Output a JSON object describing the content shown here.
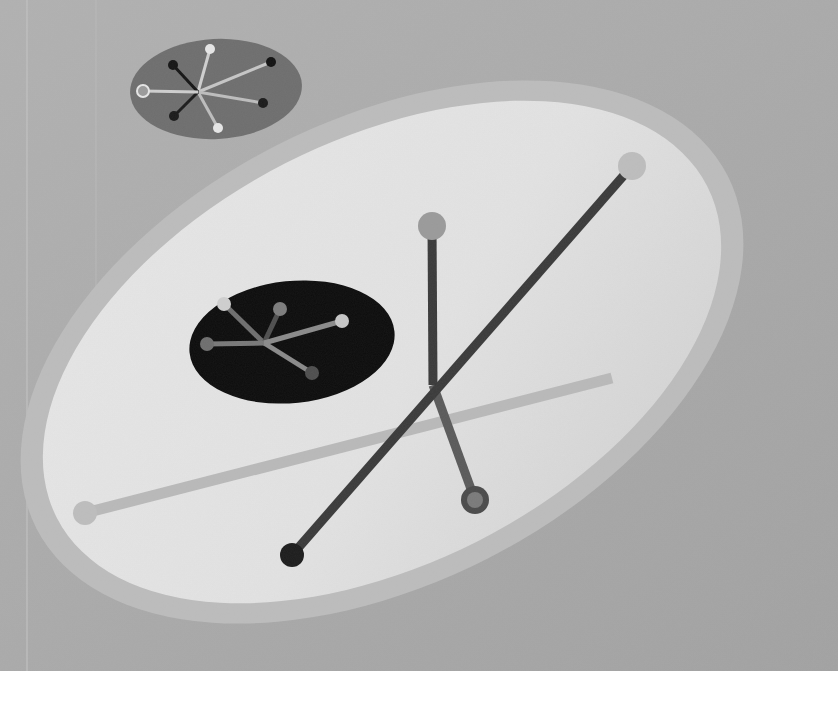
{
  "artwork": {
    "kind": "abstract painting (grayscale reproduction)",
    "canvas": {
      "width": 838,
      "height": 671
    },
    "colors": {
      "background": "#a9a9a9",
      "background_light": "#b4b4b4",
      "halo": "#bcbcbc",
      "big_ellipse": "#e3e3e3",
      "big_ellipse_shade": "#d2d2d2",
      "small_ellipse_top": "#6e6e6e",
      "small_ellipse_dark": "#0c0c0c",
      "line_dark": "#3a3a3a",
      "line_mid": "#5a5a5a",
      "line_light": "#b9b9b9",
      "page_margin": "#ffffff"
    },
    "shapes": {
      "halo": {
        "cx": 382,
        "cy": 352,
        "rx": 388,
        "ry": 232,
        "rotate": -27
      },
      "big_ellipse": {
        "cx": 382,
        "cy": 352,
        "rx": 365,
        "ry": 212,
        "rotate": -27
      },
      "top_ellipse": {
        "cx": 216,
        "cy": 89,
        "rx": 86,
        "ry": 50,
        "rotate": -3
      },
      "dark_ellipse": {
        "cx": 292,
        "cy": 342,
        "rx": 103,
        "ry": 61,
        "rotate": -6
      }
    },
    "rods": [
      {
        "name": "long-diagonal-rod",
        "x1": 292,
        "y1": 555,
        "x2": 632,
        "y2": 166,
        "color": "line_dark",
        "width": 9,
        "knob1": {
          "r": 12,
          "fill": "#1c1c1c"
        },
        "knob2": {
          "r": 14,
          "fill": "#bdbdbd"
        }
      },
      {
        "name": "vertical-rod",
        "x1": 432,
        "y1": 226,
        "x2": 433,
        "y2": 385,
        "color": "line_dark",
        "width": 9,
        "knob1": {
          "r": 14,
          "fill": "#9a9a9a"
        }
      },
      {
        "name": "slanted-rod",
        "x1": 433,
        "y1": 385,
        "x2": 475,
        "y2": 500,
        "color": "line_mid",
        "width": 9,
        "knob2": {
          "r": 14,
          "fill": "#4a4a4a",
          "inner": "#7a7a7a"
        }
      },
      {
        "name": "light-horizontal-rod",
        "x1": 85,
        "y1": 513,
        "x2": 612,
        "y2": 378,
        "color": "line_light",
        "width": 11,
        "knob1": {
          "r": 12,
          "fill": "#bdbdbd"
        }
      }
    ],
    "top_cluster": {
      "hub": {
        "x": 198,
        "y": 92
      },
      "spokes": [
        {
          "x": 210,
          "y": 49,
          "stroke": "#cfcfcf",
          "knob": "#e6e6e6",
          "r": 5
        },
        {
          "x": 271,
          "y": 62,
          "stroke": "#c6c6c6",
          "knob": "#111111",
          "r": 5
        },
        {
          "x": 263,
          "y": 103,
          "stroke": "#bdbdbd",
          "knob": "#1a1a1a",
          "r": 5
        },
        {
          "x": 218,
          "y": 128,
          "stroke": "#bdbdbd",
          "knob": "#e6e6e6",
          "r": 5
        },
        {
          "x": 174,
          "y": 116,
          "stroke": "#1a1a1a",
          "knob": "#1a1a1a",
          "r": 5
        },
        {
          "x": 173,
          "y": 65,
          "stroke": "#141414",
          "knob": "#141414",
          "r": 5
        },
        {
          "x": 143,
          "y": 91,
          "stroke": "#cfcfcf",
          "knob": "#9a9a9a",
          "r": 5,
          "ring": "#e6e6e6"
        }
      ]
    },
    "dark_cluster": {
      "hub": {
        "x": 264,
        "y": 343
      },
      "spokes": [
        {
          "x": 224,
          "y": 304,
          "stroke": "#6e6e6e",
          "knob": "#cfcfcf",
          "r": 7
        },
        {
          "x": 280,
          "y": 309,
          "stroke": "#4e4e4e",
          "knob": "#7c7c7c",
          "r": 7
        },
        {
          "x": 342,
          "y": 321,
          "stroke": "#8a8a8a",
          "knob": "#c6c6c6",
          "r": 7
        },
        {
          "x": 312,
          "y": 373,
          "stroke": "#8a8a8a",
          "knob": "#4e4e4e",
          "r": 7
        },
        {
          "x": 207,
          "y": 344,
          "stroke": "#787878",
          "knob": "#6e6e6e",
          "r": 7
        }
      ]
    }
  }
}
